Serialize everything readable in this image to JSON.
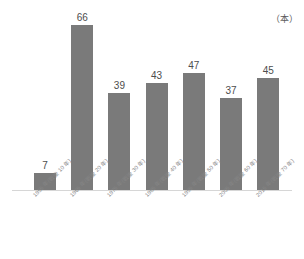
{
  "chart_data": {
    "type": "bar",
    "title": "",
    "subtitle": "",
    "xlabel": "",
    "ylabel": "",
    "unit_label": "（本）",
    "grid": false,
    "legend": false,
    "ylim": [
      0,
      66
    ],
    "categories": [
      "1955 年(戦後 10 年)",
      "1965 年(戦後 20 年)",
      "1975 年(戦後 30 年)",
      "1985 年(戦後 40 年)",
      "1995 年(戦後 50 年)",
      "2005 年(戦後 60 年)",
      "2015 年(戦後 70 年)"
    ],
    "values": [
      7,
      66,
      39,
      43,
      47,
      37,
      45
    ],
    "value_labels": [
      "7",
      "66",
      "39",
      "43",
      "47",
      "37",
      "45"
    ],
    "colors": {
      "bar": "#7a7a7a",
      "value_text": "#4d4d4d",
      "category_text": "#868686",
      "baseline": "#d6d6d6",
      "background": "#ffffff",
      "unit_text": "#5a5a5a"
    }
  }
}
